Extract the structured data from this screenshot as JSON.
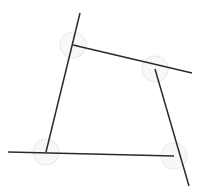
{
  "figure": {
    "background_color": "#ffffff",
    "line_color": "#2b2b2b",
    "line_width": 1.5,
    "arc_stroke_color": "#e9e9e9",
    "arc_fill_color": "#f6f6f6",
    "canvas": {
      "width": 203,
      "height": 191
    },
    "vertices": [
      {
        "name": "top-left",
        "x": 73,
        "y": 45
      },
      {
        "name": "top-right",
        "x": 155,
        "y": 69
      },
      {
        "name": "bottom-right",
        "x": 174,
        "y": 156
      },
      {
        "name": "bottom-left",
        "x": 46,
        "y": 152
      }
    ],
    "segments": [
      {
        "name": "left-segment",
        "x1": 80,
        "y1": 13,
        "x2": 46,
        "y2": 152
      },
      {
        "name": "top-segment",
        "x1": 73,
        "y1": 45,
        "x2": 192,
        "y2": 73
      },
      {
        "name": "right-segment",
        "x1": 155,
        "y1": 69,
        "x2": 189,
        "y2": 186
      },
      {
        "name": "bottom-segment",
        "x1": 8,
        "y1": 152,
        "x2": 174,
        "y2": 156
      }
    ],
    "angle_arcs": [
      {
        "name": "angle-arc-top-left",
        "cx": 73,
        "cy": 45,
        "r": 13
      },
      {
        "name": "angle-arc-top-right",
        "cx": 155,
        "cy": 69,
        "r": 13
      },
      {
        "name": "angle-arc-bottom-right",
        "cx": 174,
        "cy": 156,
        "r": 13
      },
      {
        "name": "angle-arc-bottom-left",
        "cx": 46,
        "cy": 152,
        "r": 13
      }
    ]
  },
  "chart_data": {
    "type": "scatter",
    "subtitle": "",
    "xlabel": "",
    "ylabel": "",
    "xlim": [
      0,
      203
    ],
    "ylim": [
      0,
      191
    ],
    "grid": false,
    "legend": "none",
    "annotations": [],
    "tick_labels": {
      "x": [],
      "y": []
    },
    "series": [
      {
        "name": "left-segment",
        "kind": "line",
        "x": [
          80,
          46
        ],
        "y": [
          13,
          152
        ]
      },
      {
        "name": "top-segment",
        "kind": "line",
        "x": [
          73,
          192
        ],
        "y": [
          45,
          73
        ]
      },
      {
        "name": "right-segment",
        "kind": "line",
        "x": [
          155,
          189
        ],
        "y": [
          69,
          186
        ]
      },
      {
        "name": "bottom-segment",
        "kind": "line",
        "x": [
          8,
          174
        ],
        "y": [
          152,
          156
        ]
      }
    ],
    "vertex_points": {
      "name": "quadrilateral-vertices",
      "x": [
        73,
        155,
        174,
        46
      ],
      "y": [
        45,
        69,
        156,
        152
      ],
      "labels": [
        "top-left",
        "top-right",
        "bottom-right",
        "bottom-left"
      ]
    }
  }
}
